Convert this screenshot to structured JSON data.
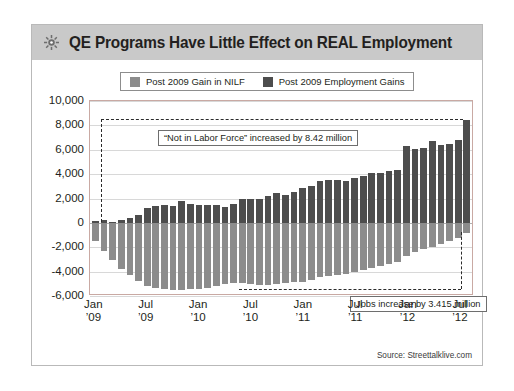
{
  "header": {
    "title": "QE Programs Have Little Effect on REAL Employment",
    "icon": "gear-icon"
  },
  "legend": {
    "items": [
      {
        "label": "Post 2009 Gain in NILF",
        "color": "#8c8c8c"
      },
      {
        "label": "Post 2009 Employment Gains",
        "color": "#4d4d4d"
      }
    ]
  },
  "annotations": {
    "top": "“Not in Labor Force” increased by 8.42 million",
    "bottom": "Jobs increase by 3.415 million"
  },
  "source": "Source: Streettalklive.com",
  "chart_data": {
    "type": "bar",
    "title": "QE Programs Have Little Effect on REAL Employment",
    "xlabel": "",
    "ylabel": "",
    "ylim": [
      -6000,
      10000
    ],
    "ytick_labels": [
      "10,000",
      "8,000",
      "6,000",
      "4,000",
      "2,000",
      "0",
      "-2,000",
      "-4,000",
      "-6,000"
    ],
    "ytick_values": [
      10000,
      8000,
      6000,
      4000,
      2000,
      0,
      -2000,
      -4000,
      -6000
    ],
    "grid": true,
    "legend_position": "top",
    "xtick_labels": [
      {
        "line1": "Jan",
        "line2": "’09",
        "index": 0
      },
      {
        "line1": "Jul",
        "line2": "’09",
        "index": 6
      },
      {
        "line1": "Jan",
        "line2": "’10",
        "index": 12
      },
      {
        "line1": "Jul",
        "line2": "’10",
        "index": 18
      },
      {
        "line1": "Jan",
        "line2": "’11",
        "index": 24
      },
      {
        "line1": "Jul",
        "line2": "’11",
        "index": 30
      },
      {
        "line1": "Jan",
        "line2": "’12",
        "index": 36
      },
      {
        "line1": "Jul",
        "line2": "’12",
        "index": 42
      }
    ],
    "categories": [
      "Jan '09",
      "Feb '09",
      "Mar '09",
      "Apr '09",
      "May '09",
      "Jun '09",
      "Jul '09",
      "Aug '09",
      "Sep '09",
      "Oct '09",
      "Nov '09",
      "Dec '09",
      "Jan '10",
      "Feb '10",
      "Mar '10",
      "Apr '10",
      "May '10",
      "Jun '10",
      "Jul '10",
      "Aug '10",
      "Sep '10",
      "Oct '10",
      "Nov '10",
      "Dec '10",
      "Jan '11",
      "Feb '11",
      "Mar '11",
      "Apr '11",
      "May '11",
      "Jun '11",
      "Jul '11",
      "Aug '11",
      "Sep '11",
      "Oct '11",
      "Nov '11",
      "Dec '11",
      "Jan '12",
      "Feb '12",
      "Mar '12",
      "Apr '12",
      "May '12",
      "Jun '12",
      "Jul '12",
      "Aug '12"
    ],
    "series": [
      {
        "name": "Post 2009 Gain in NILF",
        "color": "#4d4d4d",
        "values": [
          180,
          230,
          110,
          260,
          420,
          620,
          1180,
          1380,
          1450,
          1420,
          1820,
          1520,
          1450,
          1430,
          1430,
          1280,
          1520,
          1980,
          1980,
          1960,
          2240,
          2420,
          2260,
          2520,
          2900,
          3060,
          3400,
          3500,
          3480,
          3460,
          3720,
          3860,
          4080,
          4100,
          4250,
          4300,
          6280,
          6060,
          6120,
          6700,
          6420,
          6480,
          6800,
          8420
        ]
      },
      {
        "name": "Post 2009 Employment Gains",
        "color": "#8c8c8c",
        "values": [
          -1480,
          -2320,
          -3080,
          -3780,
          -4280,
          -4760,
          -5180,
          -5360,
          -5420,
          -5520,
          -5480,
          -5440,
          -5400,
          -5380,
          -5180,
          -5040,
          -4900,
          -4960,
          -5040,
          -5080,
          -5060,
          -5020,
          -4940,
          -4860,
          -4820,
          -4700,
          -4480,
          -4320,
          -4260,
          -4180,
          -4020,
          -3880,
          -3700,
          -3560,
          -3380,
          -3200,
          -2680,
          -2420,
          -2180,
          -1960,
          -1760,
          -1520,
          -1280,
          -860
        ]
      }
    ]
  }
}
